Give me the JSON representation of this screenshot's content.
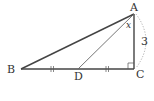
{
  "figure": {
    "type": "geometry-triangle",
    "points": {
      "A": {
        "label": "A",
        "x": 134,
        "y": 14
      },
      "B": {
        "label": "B",
        "x": 21,
        "y": 69
      },
      "C": {
        "label": "C",
        "x": 134,
        "y": 69
      },
      "D": {
        "label": "D",
        "x": 78,
        "y": 69
      }
    },
    "segments": [
      {
        "from": "A",
        "to": "B",
        "weight": "thick"
      },
      {
        "from": "B",
        "to": "C",
        "weight": "thick"
      },
      {
        "from": "A",
        "to": "C",
        "weight": "thick"
      },
      {
        "from": "A",
        "to": "D",
        "weight": "thin"
      }
    ],
    "angle_label": "x",
    "side_length_label": "3",
    "right_angle_at": "C",
    "equal_marks": "||",
    "colors": {
      "stroke": "#444444",
      "thin_stroke": "#666666",
      "dotted": "#999999",
      "text": "#333333"
    }
  }
}
